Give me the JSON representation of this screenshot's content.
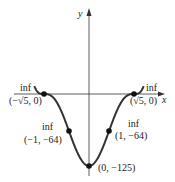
{
  "chart_data": {
    "type": "line",
    "title": "",
    "function": "f(x) = (x^2 - 5)^3",
    "xlabel": "x",
    "ylabel": "y",
    "xlim": [
      -2.9,
      2.9
    ],
    "ylim": [
      -135,
      95
    ],
    "grid": false,
    "legend": null,
    "series": [
      {
        "name": "f(x)",
        "x": [
          -2.75,
          -2.5,
          -2.236,
          -2.0,
          -1.5,
          -1.0,
          -0.5,
          0,
          0.5,
          1.0,
          1.5,
          2.0,
          2.236,
          2.5,
          2.75
        ],
        "values": [
          15.6,
          1.95,
          0,
          -1,
          -19.5,
          -64,
          -106.2,
          -125,
          -106.2,
          -64,
          -19.5,
          -1,
          0,
          1.95,
          15.6
        ]
      }
    ],
    "points": [
      {
        "label": "(−√5, 0)",
        "annotation": "inf",
        "x": -2.236,
        "y": 0
      },
      {
        "label": "(√5, 0)",
        "annotation": "inf",
        "x": 2.236,
        "y": 0
      },
      {
        "label": "(−1, −64)",
        "annotation": "inf",
        "x": -1,
        "y": -64
      },
      {
        "label": "(1, −64)",
        "annotation": "inf",
        "x": 1,
        "y": -64
      },
      {
        "label": "(0, −125)",
        "annotation": "",
        "x": 0,
        "y": -125
      }
    ]
  },
  "axes": {
    "x_label": "x",
    "y_label": "y"
  },
  "annotations": {
    "left_zero": {
      "tag": "inf",
      "coord": "(−√5, 0)"
    },
    "right_zero": {
      "tag": "inf",
      "coord": "(√5, 0)"
    },
    "left_inflect": {
      "tag": "inf",
      "coord": "(−1, −64)"
    },
    "right_inflect": {
      "tag": "inf",
      "coord": "(1, −64)"
    },
    "minimum": {
      "coord": "(0, −125)"
    }
  }
}
